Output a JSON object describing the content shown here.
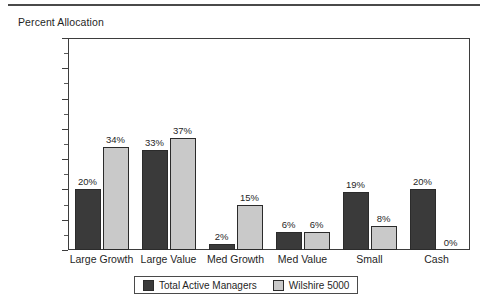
{
  "chart_data": {
    "type": "bar",
    "title": "Percent Allocation",
    "xlabel": "",
    "ylabel": "",
    "ylim": [
      0,
      70
    ],
    "ytick_step": 10,
    "yminor_step": 5,
    "grid": false,
    "legend_position": "bottom",
    "value_label_suffix": "%",
    "categories": [
      "Large Growth",
      "Large Value",
      "Med Growth",
      "Med Value",
      "Small",
      "Cash"
    ],
    "ytick_labels": [
      "0%",
      "10%",
      "20%",
      "30%",
      "40%",
      "50%",
      "60%",
      "70%"
    ],
    "ytick_values": [
      0,
      10,
      20,
      30,
      40,
      50,
      60,
      70
    ],
    "series": [
      {
        "name": "Total Active Managers",
        "color": "#3a3a3a",
        "values": [
          20,
          33,
          2,
          6,
          19,
          20
        ],
        "labels": [
          "20%",
          "33%",
          "2%",
          "6%",
          "19%",
          "20%"
        ]
      },
      {
        "name": "Wilshire 5000",
        "color": "#c9c9c9",
        "values": [
          34,
          37,
          15,
          6,
          8,
          0
        ],
        "labels": [
          "34%",
          "37%",
          "15%",
          "6%",
          "8%",
          "0%"
        ]
      }
    ]
  },
  "legend": {
    "items": [
      {
        "label": "Total Active Managers",
        "swatch": "s0"
      },
      {
        "label": "Wilshire 5000",
        "swatch": "s1"
      }
    ]
  }
}
